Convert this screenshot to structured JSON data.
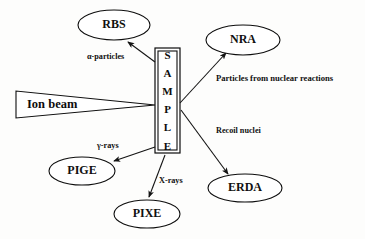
{
  "diagram": {
    "background_color": "#fdfdfc",
    "line_color": "#141414",
    "text_color": "#101010",
    "source": {
      "label": "Ion beam",
      "shape": "right-pointing-wedge",
      "x": 16,
      "y": 91,
      "width": 139,
      "height": 27,
      "tip_x": 155,
      "tip_y": 105
    },
    "sample": {
      "letters": [
        "S",
        "A",
        "M",
        "P",
        "L",
        "E"
      ],
      "text": "SAMPLE",
      "shape": "vertical-rectangle",
      "x": 155,
      "y": 48,
      "width": 25,
      "height": 105
    },
    "nodes": [
      {
        "id": "rbs",
        "label": "RBS",
        "cx": 114,
        "cy": 25,
        "rx": 36,
        "ry": 15
      },
      {
        "id": "nra",
        "label": "NRA",
        "cx": 243,
        "cy": 40,
        "rx": 37,
        "ry": 15
      },
      {
        "id": "pige",
        "label": "PIGE",
        "cx": 82,
        "cy": 171,
        "rx": 33,
        "ry": 14
      },
      {
        "id": "pixe",
        "label": "PIXE",
        "cx": 147,
        "cy": 214,
        "rx": 33,
        "ry": 14
      },
      {
        "id": "erda",
        "label": "ERDA",
        "cx": 245,
        "cy": 188,
        "rx": 37,
        "ry": 14
      }
    ],
    "edges": [
      {
        "id": "edge-rbs",
        "from": "sample",
        "to": "rbs",
        "label": "α-particles",
        "label_x": 87,
        "label_y": 57,
        "x1": 155,
        "y1": 62,
        "x2": 128,
        "y2": 42
      },
      {
        "id": "edge-nra",
        "from": "sample",
        "to": "nra",
        "label": "Particles from nuclear reactions",
        "label_x": 216,
        "label_y": 79,
        "x1": 180,
        "y1": 103,
        "x2": 226,
        "y2": 53
      },
      {
        "id": "edge-erda",
        "from": "sample",
        "to": "erda",
        "label": "Recoil nuclei",
        "label_x": 216,
        "label_y": 131,
        "x1": 181,
        "y1": 110,
        "x2": 228,
        "y2": 174
      },
      {
        "id": "edge-pige",
        "from": "sample",
        "to": "pige",
        "label": "γ-rays",
        "label_x": 97,
        "label_y": 146,
        "x1": 155,
        "y1": 147,
        "x2": 114,
        "y2": 161
      },
      {
        "id": "edge-pixe",
        "from": "sample",
        "to": "pixe",
        "label": "X-rays",
        "label_x": 159,
        "label_y": 181,
        "x1": 165,
        "y1": 155,
        "x2": 149,
        "y2": 197
      }
    ]
  }
}
